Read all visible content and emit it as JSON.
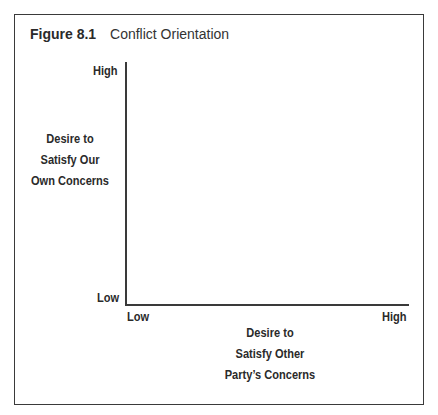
{
  "figure": {
    "number": "Figure 8.1",
    "title": "Conflict Orientation"
  },
  "y_axis": {
    "label_lines": [
      "Desire to",
      "Satisfy Our",
      "Own Concerns"
    ],
    "high": "High",
    "low": "Low"
  },
  "x_axis": {
    "label_lines": [
      "Desire to",
      "Satisfy Other",
      "Party’s Concerns"
    ],
    "high": "High",
    "low": "Low"
  },
  "colors": {
    "line": "#3a3a3a",
    "text": "#2a2a2a",
    "background": "#ffffff"
  }
}
